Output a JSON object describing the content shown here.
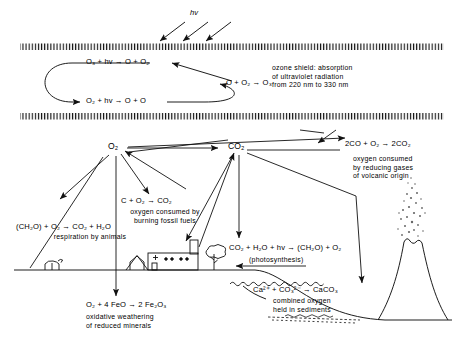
{
  "figure": {
    "ink_color": "#111111",
    "background": "#ffffff"
  },
  "stratosphere": {
    "incoming_radiation_label": "hv",
    "ozone_cycle": {
      "reaction_photolysis_ozone": "O₃ + hv → O + O₂",
      "reaction_photolysis_oxygen": "O₂ + hv → O + O",
      "reaction_formation_ozone": "O + O₂ → O₃"
    },
    "shield_note": [
      "ozone shield:  absorption",
      "of  ultraviolet  radiation",
      "from  220 nm  to  330 nm"
    ]
  },
  "nodes": {
    "oxygen": "O₂",
    "carbon_dioxide": "CO₂"
  },
  "processes": [
    {
      "id": "respiration",
      "equation": "(CH₂O) + O₂ → CO₂ + H₂O",
      "caption": [
        "respiration  by  animals"
      ]
    },
    {
      "id": "fossil-fuel-burning",
      "equation": "C + O₂ → CO₂",
      "caption": [
        "oxygen consumed by",
        "burning  fossil  fuels"
      ]
    },
    {
      "id": "volcanic-reducing-gases",
      "equation": "2CO + O₂ → 2CO₂",
      "caption": [
        "oxygen consumed",
        "by reducing gases",
        "of  volcanic  origin"
      ]
    },
    {
      "id": "photosynthesis",
      "equation": "CO₂ + H₂O + hv → (CH₂O) + O₂",
      "caption": [
        "(photosynthesis)"
      ]
    },
    {
      "id": "carbonate-sedimentation",
      "equation": "Ca²⁺ + CO₃²⁻ → CaCO₃",
      "caption": [
        "combined  oxygen",
        "held  in  sediments"
      ]
    },
    {
      "id": "oxidative-weathering",
      "equation": "O₂ + 4 FeO → 2 Fe₂O₃",
      "caption": [
        "oxidative  weathering",
        "of  reduced  minerals"
      ]
    }
  ],
  "scenery": [
    {
      "id": "animal",
      "label": "grazing animal"
    },
    {
      "id": "house",
      "label": "house"
    },
    {
      "id": "factory",
      "label": "factory with smokestack"
    },
    {
      "id": "tree",
      "label": "tree"
    },
    {
      "id": "volcano",
      "label": "erupting volcano"
    },
    {
      "id": "ocean",
      "label": "ocean basin"
    }
  ]
}
